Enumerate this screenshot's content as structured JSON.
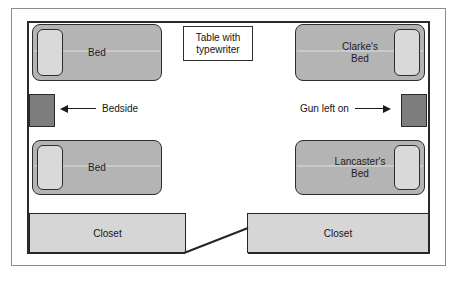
{
  "diagram": {
    "colors": {
      "bed_fill": "#b4b4b4",
      "pillow_fill": "#d9d9d9",
      "bedside_fill": "#7d7d7d",
      "closet_fill": "#d6d6d6",
      "wall_stroke": "#2a2a2a",
      "frame_stroke": "#8d8d8d",
      "background": "#ffffff",
      "text": "#141414"
    },
    "beds": [
      {
        "id": "bed-top-left",
        "label": "Bed",
        "pillow_side": "left"
      },
      {
        "id": "bed-top-right",
        "label": "Clarke's\nBed",
        "pillow_side": "right"
      },
      {
        "id": "bed-bottom-left",
        "label": "Bed",
        "pillow_side": "left"
      },
      {
        "id": "bed-bottom-right",
        "label": "Lancaster's\nBed",
        "pillow_side": "right"
      }
    ],
    "annotations": [
      {
        "id": "bedside-annotation",
        "label": "Bedside",
        "arrow": "left"
      },
      {
        "id": "gun-left-on-annotation",
        "label": "Gun left on",
        "arrow": "right"
      }
    ],
    "table": {
      "id": "table-with-typewriter",
      "label": "Table with\ntypewriter"
    },
    "closets": [
      {
        "id": "closet-left",
        "label": "Closet"
      },
      {
        "id": "closet-right",
        "label": "Closet"
      }
    ],
    "bedsides": [
      {
        "id": "bedside-table-left"
      },
      {
        "id": "bedside-table-right"
      }
    ],
    "door": {
      "id": "door-swing",
      "label": "door opening"
    }
  }
}
